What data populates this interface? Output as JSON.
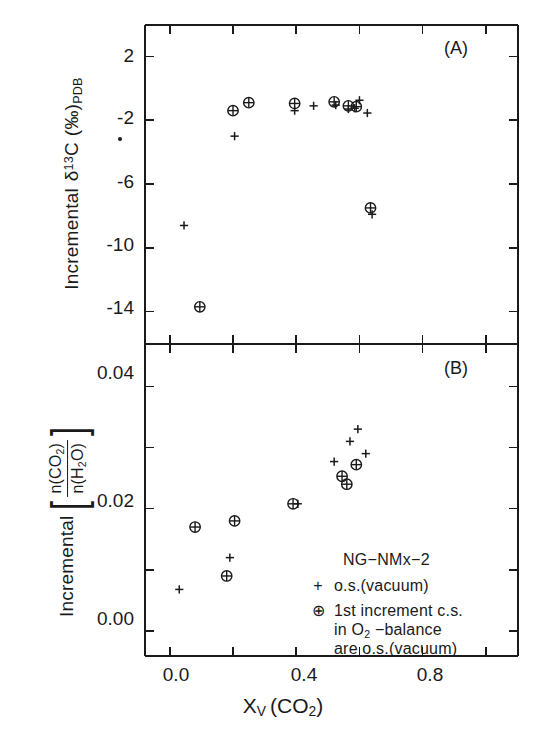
{
  "figure": {
    "xlabel": "X",
    "xlabel_sub": "V",
    "xlabel_rest": "(CO",
    "xlabel_rest_sub": "2",
    "xlabel_rest_end": ")",
    "panel_a_tag": "(A)",
    "panel_b_tag": "(B)"
  },
  "panel_a": {
    "ylabel_prefix": "Incremental",
    "ylabel_delta": "δ",
    "ylabel_sup": "13",
    "ylabel_c": "C",
    "ylabel_unit": "(‰)",
    "ylabel_sub": "PDB",
    "yticks": [
      "2",
      "-2",
      "-6",
      "-10",
      "-14"
    ]
  },
  "panel_b": {
    "ylabel_prefix": "Incremental",
    "ylabel_num": "n(CO",
    "ylabel_num_sub": "2",
    "ylabel_num_end": ")",
    "ylabel_den": "n(H",
    "ylabel_den_sub": "2",
    "ylabel_den_end": "O)",
    "yticks": [
      "0.04",
      "0.02",
      "0.00"
    ]
  },
  "xticks": [
    "0.0",
    "0.4",
    "0.8"
  ],
  "legend": {
    "title": "NG−NMx−2",
    "rows": [
      {
        "symbol": "+",
        "text": "o.s.(vacuum)"
      },
      {
        "symbol": "⊕",
        "text": "1st increment c.s."
      }
    ],
    "cont_line_1_a": "in O",
    "cont_line_1_sub": "2",
    "cont_line_1_b": " −balance",
    "cont_line_2": "are o.s.(vacuum)"
  },
  "colors": {
    "ink": "#1a1a1a",
    "background": "#ffffff"
  },
  "chart_data": [
    {
      "type": "scatter",
      "title": "(A)",
      "xlabel": "X_V (CO2)",
      "ylabel": "Incremental δ 13C (‰)PDB",
      "xlim": [
        -0.08,
        1.1
      ],
      "ylim": [
        -16.0,
        4.0
      ],
      "xticks": [
        0.0,
        0.4,
        0.8
      ],
      "yticks": [
        2,
        -2,
        -6,
        -10,
        -14
      ],
      "grid": false,
      "legend_position": "none",
      "series": [
        {
          "name": "o.s.(vacuum)",
          "marker": "plus",
          "points": [
            [
              0.045,
              -8.6
            ],
            [
              0.205,
              -3.0
            ],
            [
              0.395,
              -1.4
            ],
            [
              0.455,
              -1.1
            ],
            [
              0.525,
              -1.05
            ],
            [
              0.565,
              -1.3
            ],
            [
              0.585,
              -1.25
            ],
            [
              0.6,
              -0.75
            ],
            [
              0.625,
              -1.55
            ],
            [
              0.64,
              -7.9
            ]
          ]
        },
        {
          "name": "1st increment c.s.",
          "marker": "circled-plus",
          "points": [
            [
              0.095,
              -13.7
            ],
            [
              0.2,
              -1.4
            ],
            [
              0.25,
              -0.9
            ],
            [
              0.395,
              -0.95
            ],
            [
              0.52,
              -0.85
            ],
            [
              0.565,
              -1.1
            ],
            [
              0.59,
              -1.15
            ],
            [
              0.635,
              -7.5
            ]
          ]
        }
      ]
    },
    {
      "type": "scatter",
      "title": "(B)",
      "xlabel": "X_V (CO2)",
      "ylabel": "Incremental [n(CO2)/n(H2O)]",
      "xlim": [
        -0.08,
        1.1
      ],
      "ylim": [
        -0.004,
        0.047
      ],
      "xticks": [
        0.0,
        0.4,
        0.8
      ],
      "yticks": [
        0.04,
        0.02,
        0.0
      ],
      "grid": false,
      "legend_position": "inside-lower-right",
      "series": [
        {
          "name": "o.s.(vacuum)",
          "marker": "plus",
          "points": [
            [
              0.03,
              0.0068
            ],
            [
              0.19,
              0.012
            ],
            [
              0.405,
              0.0208
            ],
            [
              0.52,
              0.0277
            ],
            [
              0.57,
              0.031
            ],
            [
              0.595,
              0.033
            ],
            [
              0.62,
              0.029
            ]
          ]
        },
        {
          "name": "1st increment c.s.",
          "marker": "circled-plus",
          "points": [
            [
              0.08,
              0.017
            ],
            [
              0.18,
              0.009
            ],
            [
              0.205,
              0.018
            ],
            [
              0.39,
              0.0208
            ],
            [
              0.545,
              0.0253
            ],
            [
              0.56,
              0.024
            ],
            [
              0.59,
              0.0272
            ]
          ]
        }
      ]
    }
  ]
}
